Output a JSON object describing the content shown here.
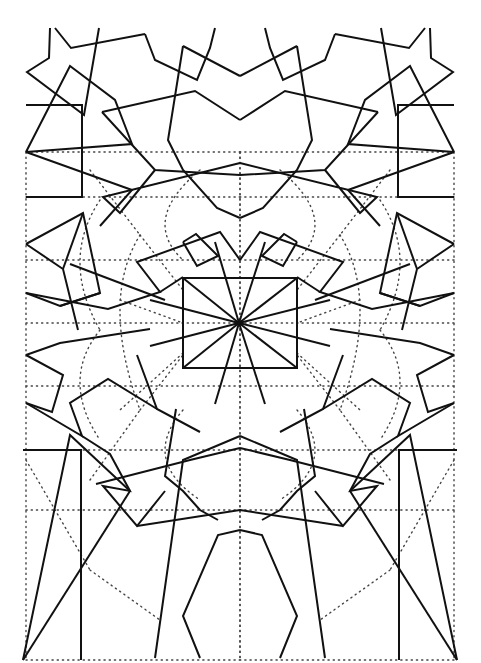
{
  "figure": {
    "title": "",
    "colors": {
      "line": "#111111",
      "construction": "#444444",
      "background": "#ffffff"
    },
    "axis_of_symmetry_x": 240,
    "center_square": {
      "x1": 183,
      "y1": 278,
      "x2": 297,
      "y2": 368
    },
    "center_point": [
      239,
      323
    ],
    "solid_paths_left": [
      "M50,28 L49,58 L27,72 L84,115 L99,28",
      "M55,28 L71,48 L145,34",
      "M145,34 L155,60 L197,80 L210,48 L215,28",
      "M26,105 L82,105 L82,197 L26,197",
      "M26,152 L70,66 L115,100 L132,144 L26,152",
      "M26,152 L132,190 L100,226",
      "M102,112 L195,91 L240,120",
      "M183,46 L168,140 L183,170 L217,208 L240,218",
      "M183,46 L240,76",
      "M102,112 L155,170 L240,175",
      "M155,170 L120,213 L103,197 L240,163",
      "M26,244 L83,213 L100,293 L60,306 L26,293",
      "M26,244 L63,269 L78,330",
      "M63,269 L83,213",
      "M26,293 L108,309 L160,292 L137,262 L220,232 L240,260",
      "M70,264 L165,300",
      "M160,292 L183,277",
      "M183,242 L196,234 L218,256 L197,266 L183,242",
      "M60,306 L100,293",
      "M26,355 L60,343 L150,329",
      "M26,355 L63,375 L52,412 L26,403",
      "M26,403 L82,436 L70,403 L108,379 L157,409",
      "M137,355 L157,409 L200,432",
      "M176,409 L165,476 L183,491 L200,510 L218,520",
      "M82,436 L110,454 L130,491 L103,486 L137,526 L165,491",
      "M23,450 L81,450 L81,660",
      "M23,660 L70,435 L130,491",
      "M23,660 L130,491",
      "M137,526 L240,510",
      "M155,658 L183,460 L240,436",
      "M200,658 L183,616 L218,535 L240,530",
      "M96,484 L190,460 L240,448"
    ],
    "dotted_paths_left": [
      "M26,152 L240,152",
      "M26,197 L240,197",
      "M26,260 L240,260",
      "M26,323 L240,323",
      "M26,386 L240,386",
      "M26,450 L240,450",
      "M26,510 L240,510",
      "M26,660 L240,660",
      "M26,152 L26,660",
      "M240,152 L240,660",
      "M90,170 L140,235",
      "M140,235 L183,290",
      "M120,300 L183,323",
      "M183,353 L120,410",
      "M140,410 L183,355",
      "M90,480 L140,410",
      "M26,460 L90,570",
      "M90,570 L160,620",
      "M140,235 Q100,300 140,410",
      "M200,170 Q140,220 183,260",
      "M183,410 Q140,460 200,500",
      "M100,200 Q60,260 100,330",
      "M100,330 Q60,380 100,440"
    ]
  }
}
